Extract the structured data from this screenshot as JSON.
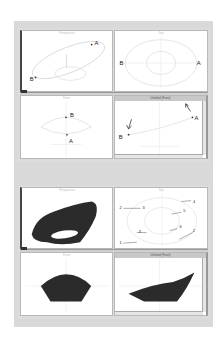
{
  "document": {
    "figures": [
      {
        "id": "top",
        "viewports": [
          {
            "position": "top-left",
            "title": "Perspective",
            "active": false,
            "labels": [
              "A",
              "B"
            ]
          },
          {
            "position": "top-right",
            "title": "Top",
            "active": false,
            "labels": [
              "B",
              "A"
            ]
          },
          {
            "position": "bottom-left",
            "title": "Front",
            "active": false,
            "labels": [
              "B",
              "A"
            ]
          },
          {
            "position": "bottom-right",
            "title": "Untitled (Front)",
            "active": true,
            "labels": [
              "B",
              "A"
            ]
          }
        ]
      },
      {
        "id": "bottom",
        "viewports": [
          {
            "position": "top-left",
            "title": "Perspective",
            "active": false,
            "labels": []
          },
          {
            "position": "top-right",
            "title": "Top",
            "active": false,
            "labels": [
              "2",
              "3",
              "4",
              "5",
              "6",
              "1",
              "2",
              "3"
            ]
          },
          {
            "position": "bottom-left",
            "title": "Front",
            "active": false,
            "labels": []
          },
          {
            "position": "bottom-right",
            "title": "Untitled (Front)",
            "active": true,
            "labels": []
          }
        ]
      }
    ]
  },
  "icons": {
    "viewport_corner": "viewport-menu-icon",
    "arrow": "arrow-icon"
  },
  "colors": {
    "page_bg": "#ffffff",
    "sheet_bg": "#d9d9d9",
    "viewport_bg": "#ffffff",
    "curve": "#c8c8c8",
    "surface": "#2b2b2b"
  }
}
